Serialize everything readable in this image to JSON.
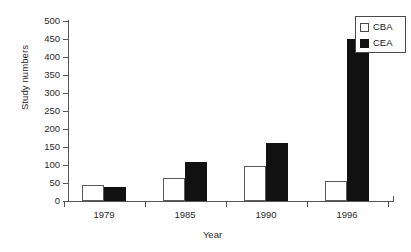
{
  "chart_data": {
    "type": "bar",
    "title": "",
    "xlabel": "Year",
    "ylabel": "Study numbers",
    "categories": [
      "1979",
      "1985",
      "1990",
      "1996"
    ],
    "series": [
      {
        "name": "CBA",
        "color": "#ffffff",
        "values": [
          45,
          65,
          98,
          55
        ]
      },
      {
        "name": "CEA",
        "color": "#111111",
        "values": [
          40,
          108,
          160,
          450
        ]
      }
    ],
    "ylim": [
      0,
      500
    ],
    "yticks": [
      0,
      50,
      100,
      150,
      200,
      250,
      300,
      350,
      400,
      450,
      500
    ],
    "ytick_labels": [
      "0",
      "50",
      "100",
      "150",
      "200",
      "250",
      "300",
      "350",
      "400",
      "450",
      "500"
    ],
    "grid": false,
    "legend_position": "top-right",
    "legend_entries": [
      "CBA",
      "CEA"
    ]
  }
}
